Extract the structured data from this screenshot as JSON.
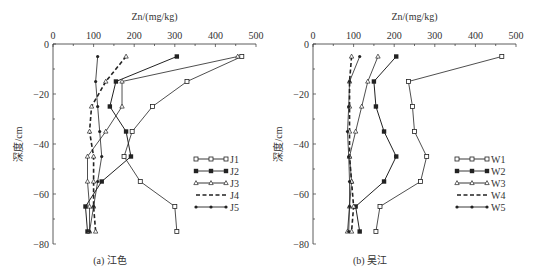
{
  "chart_data": [
    {
      "type": "line",
      "title": "(a) 江色",
      "xlabel": "Zn/(mg/kg)",
      "ylabel": "深度/cm",
      "xlim": [
        0,
        500
      ],
      "ylim": [
        -80,
        0
      ],
      "x_ticks": [
        0,
        100,
        200,
        300,
        400,
        500
      ],
      "y_ticks": [
        0,
        -20,
        -40,
        -60,
        -80
      ],
      "depths": [
        -5,
        -15,
        -25,
        -35,
        -45,
        -55,
        -65,
        -75
      ],
      "legend_position": "right-middle",
      "grid": false,
      "series": [
        {
          "name": "J1",
          "marker": "open-square",
          "dash": false,
          "values": [
            465,
            330,
            245,
            195,
            175,
            215,
            300,
            305
          ]
        },
        {
          "name": "J2",
          "marker": "filled-square",
          "dash": false,
          "values": [
            305,
            155,
            140,
            180,
            192,
            120,
            80,
            85
          ]
        },
        {
          "name": "J3",
          "marker": "open-triangle",
          "dash": false,
          "values": [
            455,
            170,
            170,
            130,
            85,
            85,
            90,
            90
          ]
        },
        {
          "name": "J4",
          "marker": "open-triangle",
          "dash": true,
          "values": [
            180,
            130,
            95,
            90,
            100,
            100,
            100,
            105
          ]
        },
        {
          "name": "J5",
          "marker": "filled-dot",
          "dash": false,
          "values": [
            110,
            105,
            110,
            115,
            120,
            110,
            100,
            90
          ]
        }
      ]
    },
    {
      "type": "line",
      "title": "(b) 吴江",
      "xlabel": "Zn/(mg/kg)",
      "ylabel": "深度/cm",
      "xlim": [
        0,
        500
      ],
      "ylim": [
        -80,
        0
      ],
      "x_ticks": [
        0,
        100,
        200,
        300,
        400,
        500
      ],
      "y_ticks": [
        0,
        -20,
        -40,
        -60,
        -80
      ],
      "depths": [
        -5,
        -15,
        -25,
        -35,
        -45,
        -55,
        -65,
        -75
      ],
      "legend_position": "right-middle",
      "grid": false,
      "series": [
        {
          "name": "W1",
          "marker": "open-square",
          "dash": false,
          "values": [
            465,
            235,
            245,
            250,
            280,
            265,
            165,
            155
          ]
        },
        {
          "name": "W2",
          "marker": "filled-square",
          "dash": false,
          "values": [
            205,
            150,
            155,
            175,
            205,
            175,
            105,
            115
          ]
        },
        {
          "name": "W3",
          "marker": "open-triangle",
          "dash": false,
          "values": [
            160,
            135,
            120,
            105,
            90,
            95,
            90,
            85
          ]
        },
        {
          "name": "W4",
          "marker": "open-triangle",
          "dash": true,
          "values": [
            95,
            90,
            90,
            90,
            90,
            95,
            100,
            95
          ]
        },
        {
          "name": "W5",
          "marker": "filled-dot",
          "dash": false,
          "values": [
            115,
            90,
            88,
            85,
            88,
            90,
            90,
            88
          ]
        }
      ]
    }
  ],
  "panels": [
    {
      "caption": "(a) 江色",
      "xlabel": "Zn/(mg/kg)",
      "ylabel": "深度/cm"
    },
    {
      "caption": "(b) 吴江",
      "xlabel": "Zn/(mg/kg)",
      "ylabel": "深度/cm"
    }
  ],
  "colors": {
    "axis": "#333333",
    "line": "#222222",
    "open_marker_fill": "#ffffff"
  }
}
